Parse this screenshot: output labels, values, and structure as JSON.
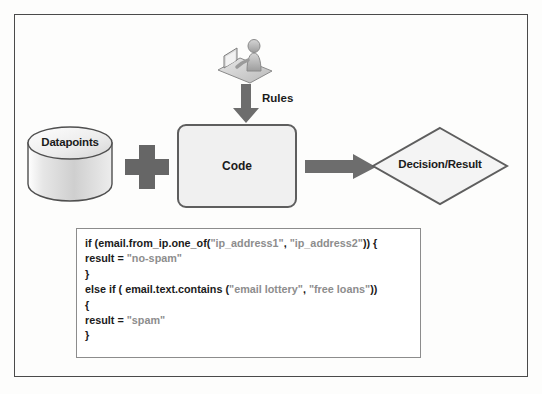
{
  "diagram": {
    "nodes": {
      "datapoints": {
        "label": "Datapoints",
        "shape": "cylinder",
        "icon": "database-icon"
      },
      "plus": {
        "label": "+",
        "icon": "plus-icon"
      },
      "code": {
        "label": "Code",
        "shape": "rounded-rectangle"
      },
      "decision": {
        "label": "Decision/Result",
        "shape": "diamond"
      },
      "rules_source": {
        "label": "Rules",
        "icon": "person-at-computer-icon"
      }
    },
    "arrows": {
      "rules_down": {
        "label": "Rules",
        "direction": "down",
        "icon": "down-block-arrow-icon"
      },
      "code_to_decision": {
        "label": "",
        "direction": "right",
        "icon": "right-block-arrow-icon"
      }
    },
    "colors": {
      "frame_border": "#4a4a4a",
      "shape_fill": "#f0f0f0",
      "shape_border": "#5e5e5e",
      "arrow_gray": "#666666",
      "text": "#1b1b1b",
      "string_literal": "#8d8d8d",
      "panel_border": "#8c8c8c"
    }
  },
  "code_panel": {
    "lines": [
      [
        {
          "t": "if (email.from_ip.one_of(",
          "k": "code"
        },
        {
          "t": "\"ip_address1\"",
          "k": "str"
        },
        {
          "t": ", ",
          "k": "code"
        },
        {
          "t": "\"ip_address2\"",
          "k": "str"
        },
        {
          "t": ")) {",
          "k": "code"
        }
      ],
      [
        {
          "t": "result = ",
          "k": "code"
        },
        {
          "t": "\"no-spam\"",
          "k": "str"
        }
      ],
      [
        {
          "t": "}",
          "k": "code"
        }
      ],
      [
        {
          "t": "else if ( email.text.contains (",
          "k": "code"
        },
        {
          "t": "\"email lottery\"",
          "k": "str"
        },
        {
          "t": ", ",
          "k": "code"
        },
        {
          "t": "\"free loans\"",
          "k": "str"
        },
        {
          "t": "))",
          "k": "code"
        }
      ],
      [
        {
          "t": "{",
          "k": "code"
        }
      ],
      [
        {
          "t": "result = ",
          "k": "code"
        },
        {
          "t": "\"spam\"",
          "k": "str"
        }
      ],
      [
        {
          "t": "}",
          "k": "code"
        }
      ]
    ]
  }
}
